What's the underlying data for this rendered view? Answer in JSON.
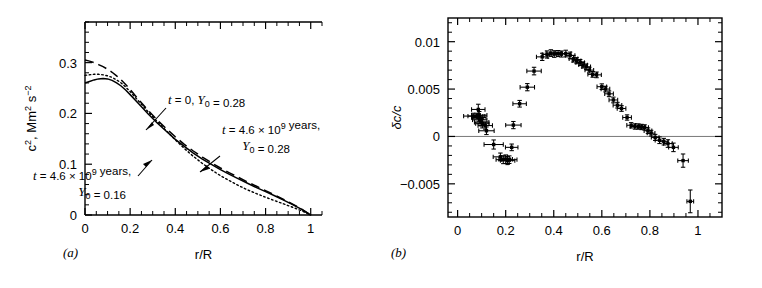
{
  "figure": {
    "panels": [
      {
        "letter": "(a)",
        "xlabel": "r/R",
        "ylabel": "c2, Mm2 s-2",
        "ylabel_parts": [
          {
            "t": "c",
            "sup": "2"
          },
          {
            "t": ", Mm",
            "sup": "2"
          },
          {
            "t": " s",
            "sup": "−2"
          }
        ],
        "xticks": [
          {
            "v": 0,
            "label": "0"
          },
          {
            "v": 0.2,
            "label": "0.2"
          },
          {
            "v": 0.4,
            "label": "0.4"
          },
          {
            "v": 0.6,
            "label": "0.6"
          },
          {
            "v": 0.8,
            "label": "0.8"
          },
          {
            "v": 1.0,
            "label": "1"
          }
        ],
        "yticks": [
          {
            "v": 0,
            "label": "0"
          },
          {
            "v": 0.1,
            "label": "0.1"
          },
          {
            "v": 0.2,
            "label": "0.2"
          },
          {
            "v": 0.3,
            "label": "0.3"
          }
        ],
        "xlim": [
          0,
          1.05
        ],
        "ylim": [
          0,
          0.38
        ],
        "annotations": [
          {
            "id": "annot-t0",
            "lines": [
              [
                {
                  "t": "t",
                  "i": true
                },
                {
                  "t": " = 0,  "
                },
                {
                  "t": "Y",
                  "i": true
                },
                {
                  "t": "0",
                  "sub": true
                },
                {
                  "t": " = 0.28"
                }
              ]
            ],
            "text": "t = 0, Y0 = 0.28"
          },
          {
            "id": "annot-t46-y028",
            "lines": [
              [
                {
                  "t": "t",
                  "i": true
                },
                {
                  "t": " = 4.6 × 10",
                  "sup9": true
                },
                {
                  "t": " years,"
                }
              ],
              [
                {
                  "t": "Y",
                  "i": true
                },
                {
                  "t": "0",
                  "sub": true
                },
                {
                  "t": " = 0.28"
                }
              ]
            ],
            "text": "t = 4.6 × 10^9 years, Y0 = 0.28"
          },
          {
            "id": "annot-t46-y016",
            "lines": [
              [
                {
                  "t": "t",
                  "i": true
                },
                {
                  "t": " = 4.6 × 10",
                  "sup9": true
                },
                {
                  "t": " years,"
                }
              ],
              [
                {
                  "t": "Y",
                  "i": true
                },
                {
                  "t": "0",
                  "sub": true
                },
                {
                  "t": " = 0.16"
                }
              ]
            ],
            "text": "t = 4.6 × 10^9 years, Y0 = 0.16"
          }
        ]
      },
      {
        "letter": "(b)",
        "xlabel": "r/R",
        "ylabel": "δc/c",
        "xticks": [
          {
            "v": 0,
            "label": "0"
          },
          {
            "v": 0.2,
            "label": "0.2"
          },
          {
            "v": 0.4,
            "label": "0.4"
          },
          {
            "v": 0.6,
            "label": "0.6"
          },
          {
            "v": 0.8,
            "label": "0.8"
          },
          {
            "v": 1.0,
            "label": "1"
          }
        ],
        "yticks": [
          {
            "v": -0.005,
            "label": "−0.005"
          },
          {
            "v": 0,
            "label": "0"
          },
          {
            "v": 0.005,
            "label": "0.005"
          },
          {
            "v": 0.01,
            "label": "0.01"
          }
        ],
        "xlim": [
          -0.04,
          1.1
        ],
        "ylim": [
          -0.0085,
          0.0125
        ]
      }
    ]
  },
  "chart_data": [
    {
      "type": "line",
      "panel": "a",
      "title": "",
      "xlabel": "r/R",
      "ylabel": "c², Mm² s⁻²",
      "xlim": [
        0,
        1.05
      ],
      "ylim": [
        0,
        0.38
      ],
      "grid": false,
      "legend": "inline-annotations",
      "series": [
        {
          "name": "t = 0, Y0 = 0.28",
          "style": "dashed",
          "x": [
            0.0,
            0.02,
            0.04,
            0.06,
            0.08,
            0.1,
            0.12,
            0.14,
            0.16,
            0.18,
            0.2,
            0.24,
            0.28,
            0.32,
            0.36,
            0.4,
            0.44,
            0.48,
            0.52,
            0.56,
            0.6,
            0.64,
            0.68,
            0.72,
            0.76,
            0.8,
            0.84,
            0.88,
            0.92,
            0.96,
            1.0
          ],
          "y": [
            0.305,
            0.303,
            0.3,
            0.296,
            0.292,
            0.287,
            0.281,
            0.274,
            0.266,
            0.257,
            0.247,
            0.226,
            0.206,
            0.187,
            0.17,
            0.154,
            0.139,
            0.126,
            0.114,
            0.103,
            0.0925,
            0.083,
            0.074,
            0.065,
            0.0565,
            0.048,
            0.0395,
            0.0305,
            0.0215,
            0.0115,
            0.0
          ]
        },
        {
          "name": "t = 4.6 × 10⁹ years, Y0 = 0.28",
          "style": "solid",
          "x": [
            0.0,
            0.02,
            0.04,
            0.06,
            0.08,
            0.1,
            0.12,
            0.14,
            0.16,
            0.18,
            0.2,
            0.24,
            0.28,
            0.32,
            0.36,
            0.4,
            0.44,
            0.48,
            0.52,
            0.56,
            0.6,
            0.64,
            0.68,
            0.72,
            0.76,
            0.8,
            0.84,
            0.88,
            0.92,
            0.96,
            1.0
          ],
          "y": [
            0.26,
            0.263,
            0.266,
            0.268,
            0.269,
            0.268,
            0.265,
            0.26,
            0.254,
            0.246,
            0.237,
            0.218,
            0.199,
            0.181,
            0.165,
            0.149,
            0.135,
            0.122,
            0.11,
            0.0995,
            0.0895,
            0.08,
            0.071,
            0.0625,
            0.054,
            0.046,
            0.0378,
            0.0292,
            0.0205,
            0.011,
            0.0
          ]
        },
        {
          "name": "t = 4.6 × 10⁹ years, Y0 = 0.16",
          "style": "dotted",
          "x": [
            0.0,
            0.02,
            0.04,
            0.06,
            0.08,
            0.1,
            0.12,
            0.14,
            0.16,
            0.18,
            0.2,
            0.24,
            0.28,
            0.32,
            0.36,
            0.4,
            0.44,
            0.48,
            0.52,
            0.56,
            0.6,
            0.64,
            0.68,
            0.72,
            0.76,
            0.8,
            0.84,
            0.88,
            0.92,
            0.96,
            1.0
          ],
          "y": [
            0.275,
            0.276,
            0.277,
            0.277,
            0.276,
            0.274,
            0.271,
            0.266,
            0.26,
            0.252,
            0.243,
            0.223,
            0.203,
            0.184,
            0.166,
            0.148,
            0.131,
            0.1155,
            0.1015,
            0.089,
            0.0775,
            0.0675,
            0.058,
            0.0495,
            0.042,
            0.035,
            0.0283,
            0.0218,
            0.0152,
            0.0082,
            0.0
          ]
        }
      ]
    },
    {
      "type": "scatter",
      "panel": "b",
      "title": "",
      "xlabel": "r/R",
      "ylabel": "δc/c",
      "xlim": [
        -0.04,
        1.1
      ],
      "ylim": [
        -0.0085,
        0.0125
      ],
      "grid": false,
      "zero_reference_line": 0,
      "points": [
        {
          "x": 0.065,
          "y": 0.00215,
          "xerr": 0.04,
          "yerr": 0.0003
        },
        {
          "x": 0.078,
          "y": 0.00215,
          "xerr": 0.035,
          "yerr": 0.0003
        },
        {
          "x": 0.086,
          "y": 0.00285,
          "xerr": 0.028,
          "yerr": 0.00055
        },
        {
          "x": 0.088,
          "y": 0.002,
          "xerr": 0.03,
          "yerr": 0.0004
        },
        {
          "x": 0.09,
          "y": 0.00225,
          "xerr": 0.032,
          "yerr": 0.00038
        },
        {
          "x": 0.092,
          "y": 0.00175,
          "xerr": 0.03,
          "yerr": 0.00042
        },
        {
          "x": 0.1,
          "y": 0.0015,
          "xerr": 0.03,
          "yerr": 0.0004
        },
        {
          "x": 0.103,
          "y": 0.00135,
          "xerr": 0.028,
          "yerr": 0.00045
        },
        {
          "x": 0.115,
          "y": 0.00115,
          "xerr": 0.03,
          "yerr": 0.00038
        },
        {
          "x": 0.12,
          "y": 0.0006,
          "xerr": 0.032,
          "yerr": 0.0004
        },
        {
          "x": 0.15,
          "y": -0.00085,
          "xerr": 0.04,
          "yerr": 0.00048
        },
        {
          "x": 0.178,
          "y": -0.00215,
          "xerr": 0.03,
          "yerr": 0.0004
        },
        {
          "x": 0.19,
          "y": -0.00245,
          "xerr": 0.03,
          "yerr": 0.00042
        },
        {
          "x": 0.2,
          "y": -0.0024,
          "xerr": 0.028,
          "yerr": 0.00045
        },
        {
          "x": 0.208,
          "y": -0.00255,
          "xerr": 0.03,
          "yerr": 0.00042
        },
        {
          "x": 0.215,
          "y": -0.00245,
          "xerr": 0.032,
          "yerr": 0.0004
        },
        {
          "x": 0.225,
          "y": -0.00115,
          "xerr": 0.026,
          "yerr": 0.00035
        },
        {
          "x": 0.232,
          "y": 0.0012,
          "xerr": 0.032,
          "yerr": 0.00038
        },
        {
          "x": 0.258,
          "y": 0.00345,
          "xerr": 0.028,
          "yerr": 0.00035
        },
        {
          "x": 0.29,
          "y": 0.0052,
          "xerr": 0.03,
          "yerr": 0.00038
        },
        {
          "x": 0.318,
          "y": 0.0069,
          "xerr": 0.03,
          "yerr": 0.0004
        },
        {
          "x": 0.352,
          "y": 0.0084,
          "xerr": 0.024,
          "yerr": 0.00038
        },
        {
          "x": 0.372,
          "y": 0.00865,
          "xerr": 0.02,
          "yerr": 0.00038
        },
        {
          "x": 0.388,
          "y": 0.0088,
          "xerr": 0.02,
          "yerr": 0.00035
        },
        {
          "x": 0.402,
          "y": 0.0087,
          "xerr": 0.02,
          "yerr": 0.00035
        },
        {
          "x": 0.418,
          "y": 0.00875,
          "xerr": 0.018,
          "yerr": 0.00032
        },
        {
          "x": 0.432,
          "y": 0.0087,
          "xerr": 0.02,
          "yerr": 0.00032
        },
        {
          "x": 0.45,
          "y": 0.00875,
          "xerr": 0.022,
          "yerr": 0.00035
        },
        {
          "x": 0.468,
          "y": 0.00855,
          "xerr": 0.02,
          "yerr": 0.00035
        },
        {
          "x": 0.482,
          "y": 0.0082,
          "xerr": 0.018,
          "yerr": 0.00035
        },
        {
          "x": 0.495,
          "y": 0.008,
          "xerr": 0.018,
          "yerr": 0.00032
        },
        {
          "x": 0.51,
          "y": 0.0078,
          "xerr": 0.018,
          "yerr": 0.00032
        },
        {
          "x": 0.522,
          "y": 0.00755,
          "xerr": 0.018,
          "yerr": 0.00032
        },
        {
          "x": 0.535,
          "y": 0.00735,
          "xerr": 0.018,
          "yerr": 0.0003
        },
        {
          "x": 0.548,
          "y": 0.007,
          "xerr": 0.018,
          "yerr": 0.0003
        },
        {
          "x": 0.562,
          "y": 0.00655,
          "xerr": 0.02,
          "yerr": 0.0003
        },
        {
          "x": 0.578,
          "y": 0.0065,
          "xerr": 0.02,
          "yerr": 0.0003
        },
        {
          "x": 0.6,
          "y": 0.00525,
          "xerr": 0.02,
          "yerr": 0.0003
        },
        {
          "x": 0.615,
          "y": 0.005,
          "xerr": 0.018,
          "yerr": 0.0003
        },
        {
          "x": 0.63,
          "y": 0.0045,
          "xerr": 0.018,
          "yerr": 0.0003
        },
        {
          "x": 0.648,
          "y": 0.00385,
          "xerr": 0.018,
          "yerr": 0.0003
        },
        {
          "x": 0.665,
          "y": 0.0033,
          "xerr": 0.018,
          "yerr": 0.0003
        },
        {
          "x": 0.682,
          "y": 0.00295,
          "xerr": 0.018,
          "yerr": 0.0003
        },
        {
          "x": 0.705,
          "y": 0.002,
          "xerr": 0.018,
          "yerr": 0.00028
        },
        {
          "x": 0.722,
          "y": 0.00118,
          "xerr": 0.018,
          "yerr": 0.00028
        },
        {
          "x": 0.738,
          "y": 0.00105,
          "xerr": 0.018,
          "yerr": 0.00028
        },
        {
          "x": 0.752,
          "y": 0.00105,
          "xerr": 0.016,
          "yerr": 0.00028
        },
        {
          "x": 0.765,
          "y": 0.001,
          "xerr": 0.016,
          "yerr": 0.00028
        },
        {
          "x": 0.778,
          "y": 0.00095,
          "xerr": 0.016,
          "yerr": 0.00028
        },
        {
          "x": 0.792,
          "y": 0.0006,
          "xerr": 0.016,
          "yerr": 0.0003
        },
        {
          "x": 0.805,
          "y": 0.00035,
          "xerr": 0.016,
          "yerr": 0.0003
        },
        {
          "x": 0.822,
          "y": -0.0001,
          "xerr": 0.016,
          "yerr": 0.00032
        },
        {
          "x": 0.84,
          "y": -0.0004,
          "xerr": 0.018,
          "yerr": 0.00035
        },
        {
          "x": 0.858,
          "y": -0.00055,
          "xerr": 0.018,
          "yerr": 0.00035
        },
        {
          "x": 0.875,
          "y": -0.00075,
          "xerr": 0.018,
          "yerr": 0.0004
        },
        {
          "x": 0.898,
          "y": -0.00115,
          "xerr": 0.02,
          "yerr": 0.00045
        },
        {
          "x": 0.938,
          "y": -0.00255,
          "xerr": 0.022,
          "yerr": 0.0007
        },
        {
          "x": 0.968,
          "y": -0.00685,
          "xerr": 0.014,
          "yerr": 0.0012
        }
      ]
    }
  ]
}
